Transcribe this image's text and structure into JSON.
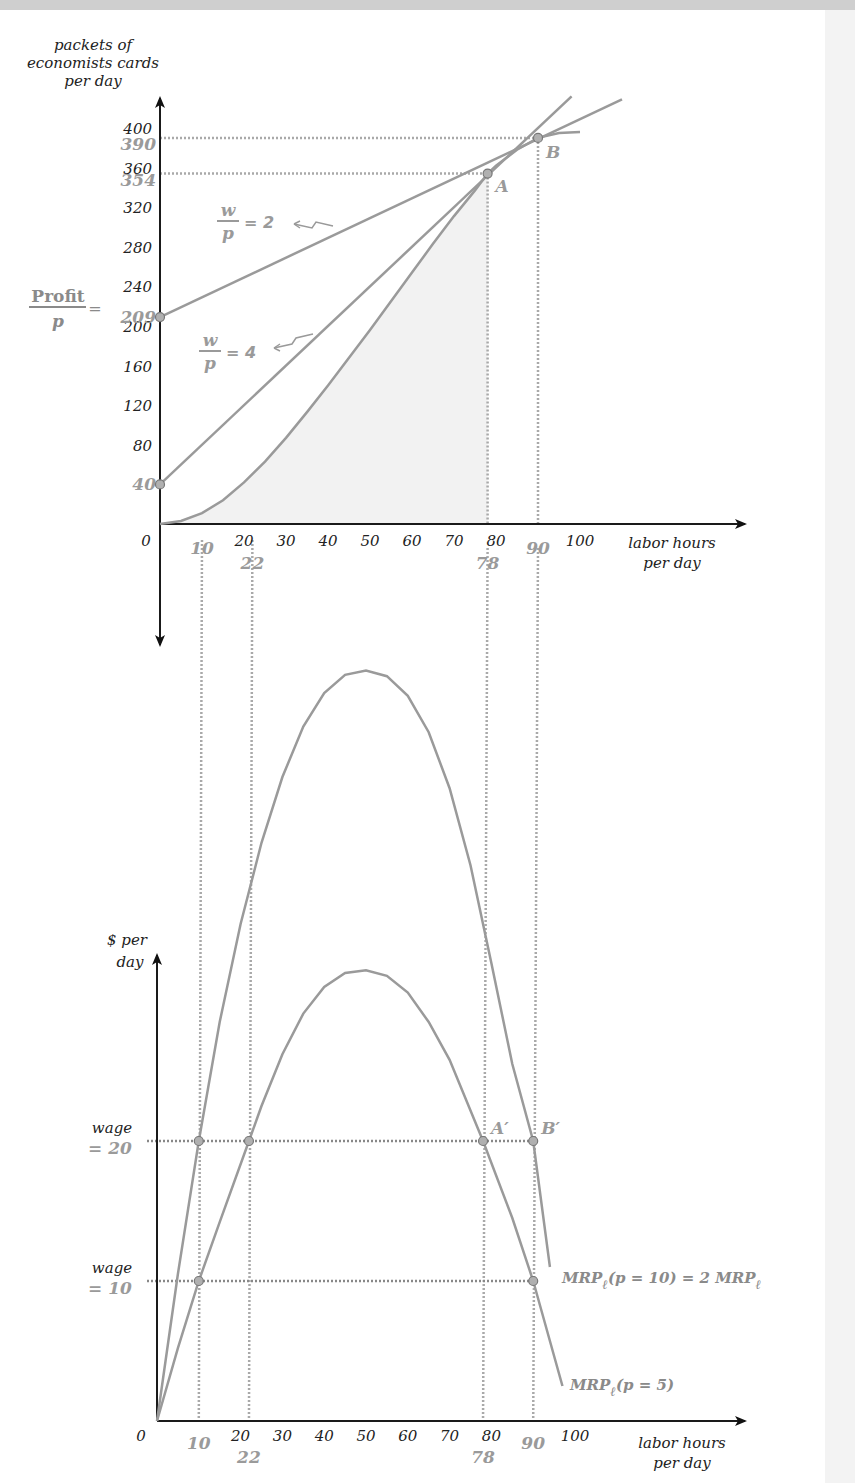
{
  "chart_data": [
    {
      "type": "line",
      "title": "",
      "ylabel": "packets of economists cards per day",
      "ylabel_lines": [
        "packets of",
        "economists cards",
        "per day"
      ],
      "xlabel_lines": [
        "labor hours",
        "per day"
      ],
      "xlim": [
        0,
        100
      ],
      "ylim": [
        0,
        400
      ],
      "x_ticks": [
        0,
        20,
        30,
        40,
        50,
        60,
        70,
        80,
        100
      ],
      "x_ticks_labels": [
        "0",
        "20",
        "30",
        "40",
        "50",
        "60",
        "70",
        "80",
        "100"
      ],
      "x_highlight_ticks": [
        10,
        22,
        78,
        90
      ],
      "x_highlight_labels": [
        "10",
        "22",
        "78",
        "90"
      ],
      "y_ticks": [
        40,
        80,
        120,
        160,
        200,
        240,
        280,
        320,
        360,
        400
      ],
      "y_ticks_labels": [
        "80",
        "120",
        "160",
        "200",
        "240",
        "280",
        "320",
        "360",
        "400"
      ],
      "y_highlight_ticks": [
        40,
        209,
        354,
        390
      ],
      "y_highlight_labels": [
        "40",
        "209",
        "354",
        "390"
      ],
      "series": [
        {
          "name": "production function",
          "x": [
            0,
            5,
            10,
            15,
            20,
            25,
            30,
            35,
            40,
            45,
            50,
            55,
            60,
            65,
            70,
            75,
            78,
            80,
            85,
            90,
            95,
            100
          ],
          "y": [
            0,
            3,
            11,
            24,
            42,
            63,
            87,
            113,
            140,
            168,
            196,
            225,
            254,
            283,
            311,
            337,
            354,
            362,
            378,
            390,
            395,
            396
          ]
        },
        {
          "name": "isoprofit w/p = 4",
          "label": "= 4",
          "x": [
            0,
            98
          ],
          "y": [
            40,
            432
          ]
        },
        {
          "name": "isoprofit w/p = 2",
          "label": "= 2",
          "x": [
            0,
            110
          ],
          "y": [
            209,
            429
          ]
        }
      ],
      "points": [
        {
          "name": "A",
          "x": 78,
          "y": 354
        },
        {
          "name": "B",
          "x": 90,
          "y": 390
        },
        {
          "name": "intercept-40",
          "x": 0,
          "y": 40
        },
        {
          "name": "intercept-209",
          "x": 0,
          "y": 209
        }
      ],
      "annotations": {
        "frac_w": "w",
        "frac_p": "p",
        "profit_num": "Profit",
        "profit_den": "p",
        "profit_eq": "=",
        "point_a": "A",
        "point_b": "B"
      }
    },
    {
      "type": "line",
      "title": "",
      "ylabel_lines": [
        "$ per",
        "day"
      ],
      "xlabel_lines": [
        "labor hours",
        "per day"
      ],
      "xlim": [
        0,
        100
      ],
      "ylim": [
        0,
        55
      ],
      "x_ticks": [
        0,
        20,
        30,
        40,
        50,
        60,
        70,
        80,
        100
      ],
      "x_ticks_labels": [
        "0",
        "20",
        "30",
        "40",
        "50",
        "60",
        "70",
        "80",
        "100"
      ],
      "x_highlight_ticks": [
        10,
        22,
        78,
        90
      ],
      "x_highlight_labels": [
        "10",
        "22",
        "78",
        "90"
      ],
      "series": [
        {
          "name": "MRP_l (p = 10) = 2 MRP_l",
          "label_main": "MRP",
          "label_sub": "ℓ",
          "label_rest": "(p = 10) = 2 ",
          "label_main2": "MRP",
          "label_sub2": "ℓ",
          "x": [
            0,
            5,
            10,
            15,
            20,
            25,
            30,
            35,
            40,
            45,
            50,
            55,
            60,
            65,
            70,
            75,
            80,
            85,
            90,
            94
          ],
          "y": [
            0,
            10.5,
            20,
            28.5,
            35.5,
            41.3,
            46,
            49.6,
            52,
            53.3,
            53.6,
            53.2,
            51.8,
            49.2,
            45.2,
            39.7,
            32.7,
            25.5,
            20,
            11
          ]
        },
        {
          "name": "MRP_l (p = 5)",
          "label_main": "MRP",
          "label_sub": "ℓ",
          "label_rest": "(p = 5)",
          "x": [
            0,
            5,
            10,
            15,
            22,
            25,
            30,
            35,
            40,
            45,
            50,
            55,
            60,
            65,
            70,
            78,
            85,
            90,
            97
          ],
          "y": [
            0,
            5.2,
            10,
            14.2,
            20,
            22.5,
            26.2,
            29.1,
            31,
            32,
            32.2,
            31.8,
            30.6,
            28.5,
            25.8,
            20,
            14.5,
            10,
            2.5
          ]
        }
      ],
      "wage_lines": [
        {
          "label_top": "wage",
          "label_bottom": "= 20",
          "value": 20
        },
        {
          "label_top": "wage",
          "label_bottom": "= 10",
          "value": 10
        }
      ],
      "points": [
        {
          "name": "p10-w20-left",
          "x": 10,
          "y": 20
        },
        {
          "name": "p5-w20-left",
          "x": 22,
          "y": 20
        },
        {
          "name": "A-prime",
          "x": 78,
          "y": 20,
          "label": "A′"
        },
        {
          "name": "B-prime",
          "x": 90,
          "y": 20,
          "label": "B′"
        },
        {
          "name": "p5-w10-left",
          "x": 10,
          "y": 10
        },
        {
          "name": "p5-w10-right",
          "x": 90,
          "y": 10
        }
      ]
    }
  ]
}
